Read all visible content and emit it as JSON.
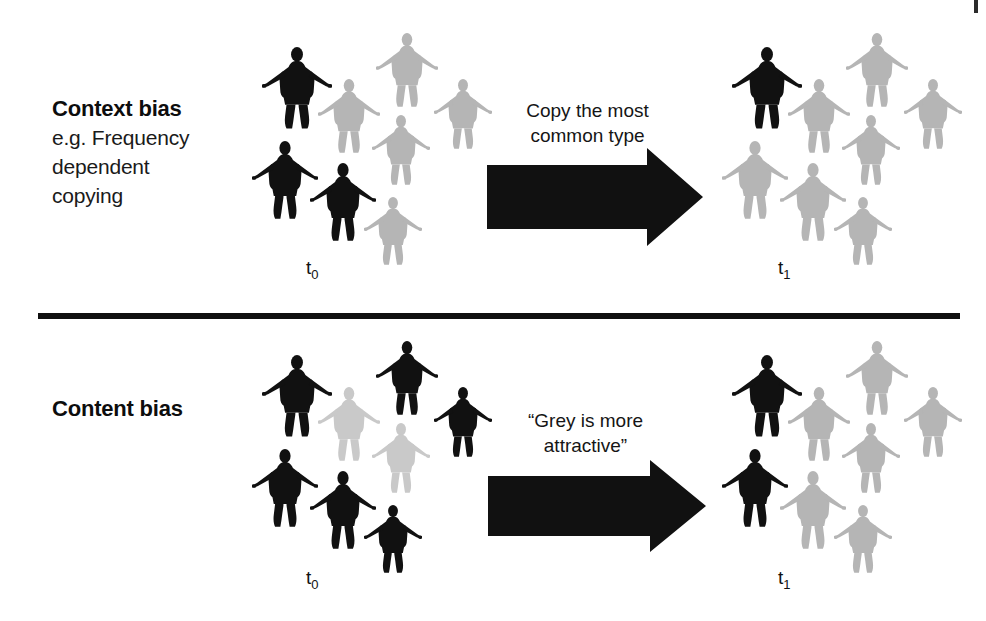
{
  "figure": {
    "divider_color": "#101010",
    "background": "#ffffff"
  },
  "colors": {
    "black_figure": "#111111",
    "grey_figure": "#b5b5b5",
    "pale_grey_figure": "#c9c9c9",
    "arrow": "#111111",
    "text": "#111111"
  },
  "panels": [
    {
      "id": "context-bias",
      "label": {
        "title": "Context bias",
        "subtitle_lines": [
          "e.g. Frequency",
          "dependent",
          "copying"
        ]
      },
      "arrow": {
        "caption_lines": [
          "Copy the most",
          "common type"
        ],
        "direction": "right"
      },
      "before": {
        "time_label": "t",
        "time_subscript": "0",
        "black_count": 3,
        "grey_count": 5,
        "total": 8,
        "figures": [
          {
            "x": 14,
            "y": 24,
            "w": 70,
            "h": 84,
            "tone": "black"
          },
          {
            "x": 128,
            "y": 10,
            "w": 62,
            "h": 76,
            "tone": "grey"
          },
          {
            "x": 70,
            "y": 56,
            "w": 62,
            "h": 76,
            "tone": "grey"
          },
          {
            "x": 186,
            "y": 56,
            "w": 58,
            "h": 72,
            "tone": "grey"
          },
          {
            "x": 124,
            "y": 92,
            "w": 58,
            "h": 72,
            "tone": "grey"
          },
          {
            "x": 4,
            "y": 118,
            "w": 66,
            "h": 80,
            "tone": "black"
          },
          {
            "x": 62,
            "y": 140,
            "w": 66,
            "h": 80,
            "tone": "black"
          },
          {
            "x": 116,
            "y": 174,
            "w": 58,
            "h": 70,
            "tone": "grey"
          }
        ]
      },
      "after": {
        "time_label": "t",
        "time_subscript": "1",
        "black_count": 1,
        "grey_count": 7,
        "total": 8,
        "figures": [
          {
            "x": 14,
            "y": 24,
            "w": 70,
            "h": 84,
            "tone": "black"
          },
          {
            "x": 128,
            "y": 10,
            "w": 62,
            "h": 76,
            "tone": "grey"
          },
          {
            "x": 70,
            "y": 56,
            "w": 62,
            "h": 76,
            "tone": "grey"
          },
          {
            "x": 186,
            "y": 56,
            "w": 58,
            "h": 72,
            "tone": "grey"
          },
          {
            "x": 124,
            "y": 92,
            "w": 58,
            "h": 72,
            "tone": "grey"
          },
          {
            "x": 4,
            "y": 118,
            "w": 66,
            "h": 80,
            "tone": "grey"
          },
          {
            "x": 62,
            "y": 140,
            "w": 66,
            "h": 80,
            "tone": "grey"
          },
          {
            "x": 116,
            "y": 174,
            "w": 58,
            "h": 70,
            "tone": "grey"
          }
        ]
      }
    },
    {
      "id": "content-bias",
      "label": {
        "title": "Content bias",
        "subtitle_lines": []
      },
      "arrow": {
        "caption_lines": [
          "“Grey is more",
          "attractive”"
        ],
        "direction": "right"
      },
      "before": {
        "time_label": "t",
        "time_subscript": "0",
        "black_count": 6,
        "grey_count": 2,
        "total": 8,
        "figures": [
          {
            "x": 14,
            "y": 24,
            "w": 70,
            "h": 84,
            "tone": "black"
          },
          {
            "x": 128,
            "y": 10,
            "w": 62,
            "h": 76,
            "tone": "black"
          },
          {
            "x": 70,
            "y": 56,
            "w": 62,
            "h": 76,
            "tone": "pale"
          },
          {
            "x": 186,
            "y": 56,
            "w": 58,
            "h": 72,
            "tone": "black"
          },
          {
            "x": 124,
            "y": 92,
            "w": 58,
            "h": 72,
            "tone": "pale"
          },
          {
            "x": 4,
            "y": 118,
            "w": 66,
            "h": 80,
            "tone": "black"
          },
          {
            "x": 62,
            "y": 140,
            "w": 66,
            "h": 80,
            "tone": "black"
          },
          {
            "x": 116,
            "y": 174,
            "w": 58,
            "h": 70,
            "tone": "black"
          }
        ]
      },
      "after": {
        "time_label": "t",
        "time_subscript": "1",
        "black_count": 2,
        "grey_count": 6,
        "total": 8,
        "figures": [
          {
            "x": 14,
            "y": 24,
            "w": 70,
            "h": 84,
            "tone": "black"
          },
          {
            "x": 128,
            "y": 10,
            "w": 62,
            "h": 76,
            "tone": "grey"
          },
          {
            "x": 70,
            "y": 56,
            "w": 62,
            "h": 76,
            "tone": "grey"
          },
          {
            "x": 186,
            "y": 56,
            "w": 58,
            "h": 72,
            "tone": "grey"
          },
          {
            "x": 124,
            "y": 92,
            "w": 58,
            "h": 72,
            "tone": "grey"
          },
          {
            "x": 4,
            "y": 118,
            "w": 66,
            "h": 80,
            "tone": "black"
          },
          {
            "x": 62,
            "y": 140,
            "w": 66,
            "h": 80,
            "tone": "grey"
          },
          {
            "x": 116,
            "y": 174,
            "w": 58,
            "h": 70,
            "tone": "grey"
          }
        ]
      }
    }
  ]
}
